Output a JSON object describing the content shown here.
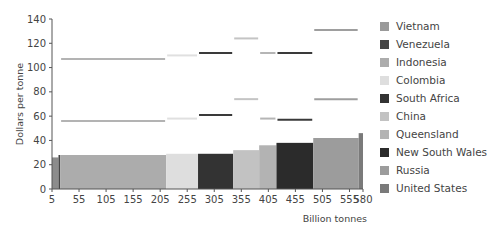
{
  "chart_data": {
    "type": "bar",
    "subtype": "variable-width supply cost curve",
    "title": "",
    "xlabel": "Billion tonnes",
    "ylabel": "Dollars per tonne",
    "xlim": [
      5,
      580
    ],
    "ylim": [
      0,
      140
    ],
    "x_ticks": [
      5,
      55,
      105,
      155,
      205,
      255,
      305,
      355,
      405,
      455,
      505,
      555,
      580
    ],
    "y_ticks": [
      0,
      20,
      40,
      60,
      80,
      100,
      120,
      140
    ],
    "grid": false,
    "legend_position": "right",
    "legend": [
      {
        "name": "Vietnam",
        "color": "#9a9a9a"
      },
      {
        "name": "Venezuela",
        "color": "#454545"
      },
      {
        "name": "Indonesia",
        "color": "#acacac"
      },
      {
        "name": "Colombia",
        "color": "#dedede"
      },
      {
        "name": "South Africa",
        "color": "#333333"
      },
      {
        "name": "China",
        "color": "#c2c2c2"
      },
      {
        "name": "Queensland",
        "color": "#b3b3b3"
      },
      {
        "name": "New South Wales",
        "color": "#2b2b2b"
      },
      {
        "name": "Russia",
        "color": "#9c9c9c"
      },
      {
        "name": "United States",
        "color": "#7a7a7a"
      }
    ],
    "bars": [
      {
        "name": "Vietnam",
        "x_start": 5,
        "x_end": 17,
        "value": 26,
        "color": "#8c8c8c"
      },
      {
        "name": "Venezuela",
        "x_start": 17,
        "x_end": 20,
        "value": 28,
        "color": "#454545"
      },
      {
        "name": "Indonesia",
        "x_start": 20,
        "x_end": 216,
        "value": 28,
        "color": "#acacac"
      },
      {
        "name": "Colombia",
        "x_start": 216,
        "x_end": 275,
        "value": 29,
        "color": "#dedede"
      },
      {
        "name": "South Africa",
        "x_start": 275,
        "x_end": 340,
        "value": 29,
        "color": "#333333"
      },
      {
        "name": "China",
        "x_start": 340,
        "x_end": 388,
        "value": 32,
        "color": "#c2c2c2"
      },
      {
        "name": "Queensland",
        "x_start": 388,
        "x_end": 420,
        "value": 36,
        "color": "#b3b3b3"
      },
      {
        "name": "New South Wales",
        "x_start": 420,
        "x_end": 488,
        "value": 38,
        "color": "#2b2b2b"
      },
      {
        "name": "Russia",
        "x_start": 488,
        "x_end": 572,
        "value": 42,
        "color": "#9c9c9c"
      },
      {
        "name": "United States",
        "x_start": 572,
        "x_end": 580,
        "value": 46,
        "color": "#7a7a7a"
      }
    ],
    "price_lines": [
      {
        "name": "Indonesia",
        "x_start": 20,
        "x_end": 216,
        "upper": 107,
        "lower": 56,
        "color": "#b3b3b3"
      },
      {
        "name": "Colombia",
        "x_start": 216,
        "x_end": 275,
        "upper": 110,
        "lower": 58,
        "color": "#e0e0e0"
      },
      {
        "name": "South Africa",
        "x_start": 275,
        "x_end": 340,
        "upper": 112,
        "lower": 61,
        "color": "#3a3a3a"
      },
      {
        "name": "China",
        "x_start": 340,
        "x_end": 388,
        "upper": 124,
        "lower": 74,
        "color": "#c4c4c4"
      },
      {
        "name": "Queensland",
        "x_start": 388,
        "x_end": 420,
        "upper": 112,
        "lower": 58,
        "color": "#b5b5b5"
      },
      {
        "name": "New South Wales",
        "x_start": 420,
        "x_end": 488,
        "upper": 112,
        "lower": 57,
        "color": "#3a3a3a"
      },
      {
        "name": "Russia",
        "x_start": 488,
        "x_end": 572,
        "upper": 131,
        "lower": 74,
        "color": "#9e9e9e"
      }
    ]
  }
}
